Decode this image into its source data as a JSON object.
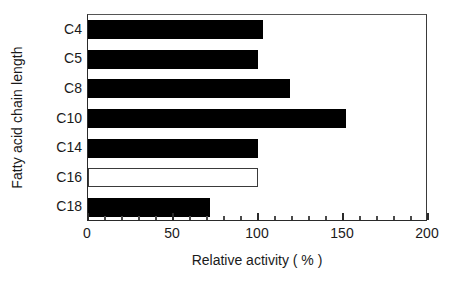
{
  "chart_data": {
    "type": "bar",
    "orientation": "horizontal",
    "title": "",
    "categories": [
      "C4",
      "C5",
      "C8",
      "C10",
      "C14",
      "C16",
      "C18"
    ],
    "values": [
      103,
      100,
      119,
      152,
      100,
      100,
      72
    ],
    "bar_styles": [
      "filled",
      "filled",
      "filled",
      "filled",
      "filled",
      "hollow",
      "filled"
    ],
    "xlabel": "Relative activity ( % )",
    "ylabel": "Fatty acid chain length",
    "xlim": [
      0,
      200
    ],
    "xticks": [
      0,
      50,
      100,
      150,
      200
    ],
    "xtick_labels": [
      "0",
      "50",
      "100",
      "150",
      "200"
    ],
    "minor_tick_interval": 10,
    "grid": false,
    "legend": null,
    "colors": {
      "bar_fill": "#000000",
      "bar_hollow_fill": "#ffffff",
      "bar_hollow_border": "#3a3a3a",
      "axis": "#2a2a2a",
      "text": "#1a1a1a",
      "background": "#ffffff"
    }
  }
}
